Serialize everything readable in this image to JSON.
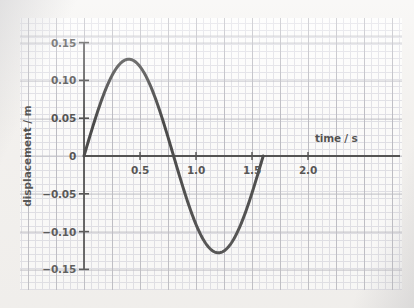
{
  "chart_data": {
    "type": "line",
    "title": "",
    "xlabel": "time / s",
    "ylabel": "displacement / m",
    "xlim": [
      -0.07,
      2.15
    ],
    "ylim": [
      -0.165,
      0.165
    ],
    "xticks": [
      "0.5",
      "1.0",
      "1.5",
      "2.0"
    ],
    "xtick_values": [
      0.5,
      1.0,
      1.5,
      2.0
    ],
    "yticks": [
      "0.15",
      "0.10",
      "0.05",
      "0",
      "−0.05",
      "−0.10",
      "−0.15"
    ],
    "ytick_values": [
      0.15,
      0.1,
      0.05,
      0,
      -0.05,
      -0.1,
      -0.15
    ],
    "grid": "graph paper: minor squares with major gridlines every 4 squares",
    "legend": "none",
    "series": [
      {
        "name": "displacement",
        "form": "sine",
        "amplitude": 0.128,
        "period": 1.6,
        "phase": 0,
        "x_start": 0.0,
        "x_end": 1.6,
        "color": "#111111",
        "linewidth": 3,
        "x": [
          0.0,
          0.1,
          0.2,
          0.3,
          0.4,
          0.5,
          0.6,
          0.7,
          0.8,
          0.9,
          1.0,
          1.1,
          1.2,
          1.3,
          1.4,
          1.5,
          1.6
        ],
        "values": [
          0.0,
          0.049,
          0.09,
          0.118,
          0.128,
          0.118,
          0.09,
          0.049,
          0.0,
          -0.049,
          -0.09,
          -0.118,
          -0.128,
          -0.118,
          -0.09,
          -0.049,
          0.0
        ]
      }
    ],
    "annotations": {
      "peak": {
        "x": 0.4,
        "y": 0.128
      },
      "trough": {
        "x": 1.2,
        "y": -0.128
      },
      "zero_crossings": [
        0.0,
        0.8,
        1.6
      ]
    }
  },
  "axes": {
    "x_axis_name": "time-axis",
    "y_axis_name": "displacement-axis"
  },
  "colors": {
    "curve": "#111111",
    "axis": "#1a1a1a",
    "grid_major": "#a9a9b2",
    "grid_minor": "#d8d8e0",
    "paper": "#f2f0ed",
    "plot_bg": "#fdfdfc"
  }
}
